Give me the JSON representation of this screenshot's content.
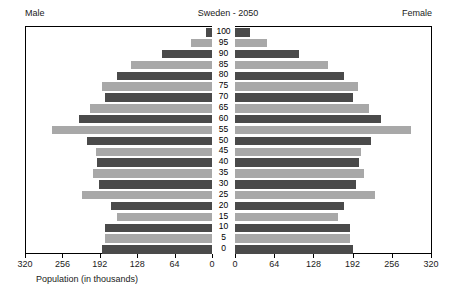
{
  "header": {
    "male_label": "Male",
    "female_label": "Female",
    "title": "Sweden - 2050"
  },
  "axis": {
    "caption": "Population (in thousands)",
    "male_ticks": [
      "320",
      "256",
      "192",
      "128",
      "64",
      "0"
    ],
    "female_ticks": [
      "0",
      "64",
      "128",
      "192",
      "256",
      "320"
    ],
    "max": 320,
    "tick_step": 64
  },
  "colors": {
    "bar_dark": "#4a4a4a",
    "bar_light": "#a8a8a8",
    "frame": "#000000",
    "background": "#ffffff",
    "text": "#1a1a1a"
  },
  "chart_data": {
    "type": "bar",
    "title": "Sweden - 2050",
    "subtitle": "",
    "xlabel": "Population (in thousands)",
    "ylabel": "Age",
    "orientation": "horizontal",
    "layout": "population-pyramid",
    "grid": false,
    "legend": "none",
    "xlim": [
      0,
      320
    ],
    "categories": [
      "100",
      "95",
      "90",
      "85",
      "80",
      "75",
      "70",
      "65",
      "60",
      "55",
      "50",
      "45",
      "40",
      "35",
      "30",
      "25",
      "20",
      "15",
      "10",
      "5",
      "0"
    ],
    "series": [
      {
        "name": "Male",
        "side": "left",
        "values": [
          12,
          38,
          88,
          140,
          165,
          190,
          185,
          210,
          230,
          275,
          215,
          200,
          198,
          205,
          195,
          225,
          175,
          165,
          185,
          185,
          190
        ]
      },
      {
        "name": "Female",
        "side": "right",
        "values": [
          24,
          52,
          105,
          152,
          178,
          200,
          192,
          218,
          238,
          288,
          222,
          205,
          202,
          210,
          198,
          228,
          178,
          168,
          188,
          188,
          192
        ]
      }
    ],
    "bar_shades": [
      "dark",
      "light",
      "dark",
      "light",
      "dark",
      "light",
      "dark",
      "light",
      "dark",
      "light",
      "dark",
      "light",
      "dark",
      "light",
      "dark",
      "light",
      "dark",
      "light",
      "dark",
      "light",
      "dark"
    ]
  }
}
